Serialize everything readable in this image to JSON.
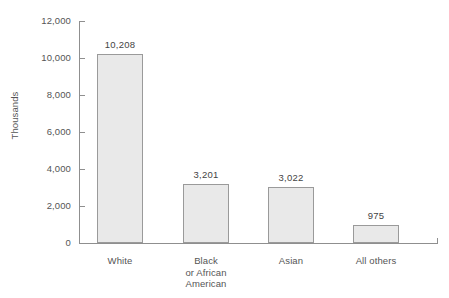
{
  "chart_data": {
    "type": "bar",
    "title": "",
    "xlabel": "",
    "ylabel": "Thousands",
    "ylim": [
      0,
      12000
    ],
    "grid": false,
    "legend": null,
    "categories": [
      "White",
      "Black or African American",
      "Asian",
      "All others"
    ],
    "category_label_lines": [
      [
        "White"
      ],
      [
        "Black",
        "or African",
        "American"
      ],
      [
        "Asian"
      ],
      [
        "All others"
      ]
    ],
    "values": [
      10208,
      3201,
      3022,
      975
    ],
    "value_labels": [
      "10,208",
      "3,201",
      "3,022",
      "975"
    ],
    "y_ticks": [
      0,
      2000,
      4000,
      6000,
      8000,
      10000,
      12000
    ],
    "y_tick_labels": [
      "0",
      "2,000",
      "4,000",
      "6,000",
      "8,000",
      "10,000",
      "12,000"
    ],
    "colors": {
      "bar_fill": "#e9e9e9",
      "bar_border": "#9a9a9a",
      "axis": "#8f8f8f",
      "text": "#555555",
      "background": "#ffffff"
    }
  }
}
